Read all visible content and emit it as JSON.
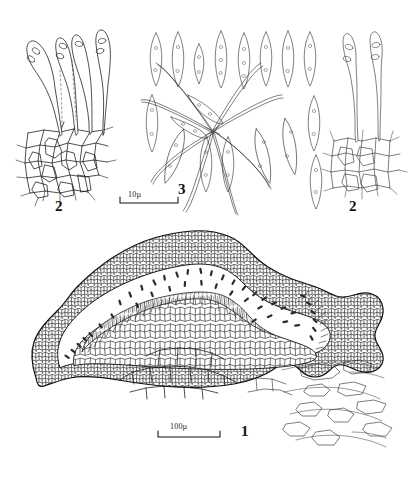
{
  "plate": {
    "title": "Mycological line-drawing plate",
    "background_color": "#ffffff",
    "ink_color": "#111111",
    "width": 412,
    "height": 477
  },
  "figures": [
    {
      "id": "fig-1",
      "label": "1",
      "caption_label": "1",
      "subject": "apothecium vertical section",
      "description": "Vertical section through apothecium showing cortex of small polygonal cells, hymenium with palisade of asci, subhymenial tissue and host cells below",
      "scale_bar": {
        "label": "100µ",
        "value": 100,
        "unit": "µ",
        "length_px": 62
      }
    },
    {
      "id": "fig-2-left",
      "label": "2",
      "caption_label": "2",
      "subject": "asci with ascospores on cellular base",
      "description": "Four clavate asci bearing ascospores arising from a base of thick-walled polygonal cells"
    },
    {
      "id": "fig-3",
      "label": "3",
      "caption_label": "3",
      "subject": "ascospores and paraphyses",
      "description": "Fusiform ascospores with internal guttules arranged in rows, with curved tapering paraphyses radiating from a centre",
      "scale_bar": {
        "label": "10µ",
        "value": 10,
        "unit": "µ",
        "length_px": 58
      }
    },
    {
      "id": "fig-2-right",
      "label": "2",
      "caption_label": "2",
      "subject": "asci with ascospores on cellular base",
      "description": "Two slender asci bearing ascospores arising from a base of polygonal cells"
    }
  ],
  "scale_bars": [
    {
      "id": "scale-10",
      "label": "10µ",
      "belongs_to": "3"
    },
    {
      "id": "scale-100",
      "label": "100µ",
      "belongs_to": "1"
    }
  ],
  "labels": {
    "fig1": "1",
    "fig2_left": "2",
    "fig2_right": "2",
    "fig3": "3",
    "scale_10": "10µ",
    "scale_100": "100µ"
  }
}
